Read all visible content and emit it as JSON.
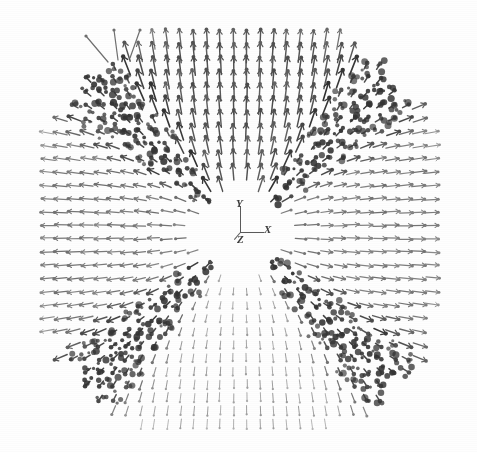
{
  "figure": {
    "title": "",
    "caption": "",
    "background_color": "#fefefe",
    "ink_color": "#4a4a4a",
    "dark_band_color": "#3a3a3a",
    "light_arrow_color": "#9a9a9a",
    "width": 477,
    "height": 452
  },
  "axis_triad": {
    "name": "xyz-axis-triad",
    "origin": {
      "x": 240,
      "y": 232
    },
    "labels": {
      "y": "Y",
      "x": "X",
      "z": "Z"
    },
    "y_label_pos": {
      "x": 236,
      "y": 198
    },
    "x_label_pos": {
      "x": 264,
      "y": 224
    },
    "z_label_pos": {
      "x": 237,
      "y": 234
    },
    "y_axis_length": 26,
    "x_axis_length": 24,
    "z_axis_length": 9,
    "z_direction_deg": 230
  },
  "chart_data": {
    "type": "scatter",
    "title": "",
    "subtitle": "",
    "xlabel": "",
    "ylabel": "",
    "legend": [],
    "grid": false,
    "field_type": "radial-vortex",
    "grid_nx": 30,
    "grid_ny": 30,
    "grid_spacing_px": 13.2,
    "grid_origin": {
      "x": 240,
      "y": 232
    },
    "core_radius_px": 46,
    "field_radius_px": 215,
    "xlim": [
      -15,
      15
    ],
    "ylim": [
      -15,
      15
    ],
    "wall_angles_deg": [
      45,
      135,
      225,
      315
    ],
    "wall_half_width_deg": 7.5,
    "quadrants": [
      {
        "name": "top",
        "angle_deg": 90,
        "arrow_dir": "up",
        "shade": "dark"
      },
      {
        "name": "right",
        "angle_deg": 0,
        "arrow_dir": "right",
        "shade": "mid"
      },
      {
        "name": "bottom",
        "angle_deg": 270,
        "arrow_dir": "down",
        "shade": "light"
      },
      {
        "name": "left",
        "angle_deg": 180,
        "arrow_dir": "left",
        "shade": "mid"
      }
    ],
    "series": [
      {
        "name": "vector-field-arrows",
        "values": []
      },
      {
        "name": "domain-wall-bands",
        "values": []
      }
    ]
  }
}
